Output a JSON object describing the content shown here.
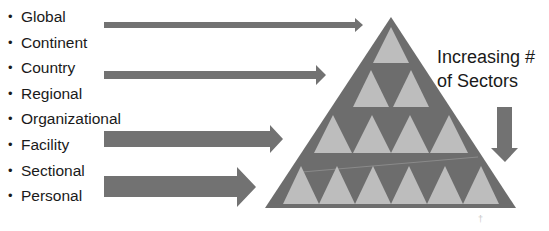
{
  "levels": [
    {
      "label": "Global"
    },
    {
      "label": "Continent"
    },
    {
      "label": "Country"
    },
    {
      "label": "Regional"
    },
    {
      "label": "Organizational"
    },
    {
      "label": "Facility"
    },
    {
      "label": "Sectional"
    },
    {
      "label": "Personal"
    }
  ],
  "annotation": {
    "line1": "Increasing #",
    "line2": "of Sectors"
  },
  "colors": {
    "pyramid": "#6d6d6d",
    "inner_triangles": "#bdbdbd",
    "arrows": "#727272",
    "text": "#1a1a1a"
  },
  "pyramid_rows": [
    1,
    2,
    4,
    6
  ]
}
